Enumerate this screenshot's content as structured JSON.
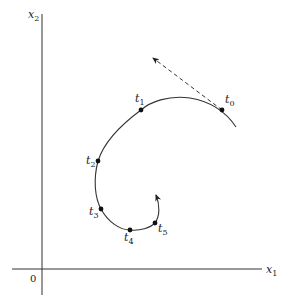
{
  "axes": {
    "x_label": {
      "base": "x",
      "sub": "1"
    },
    "y_label": {
      "base": "x",
      "sub": "2"
    },
    "origin_label": "0"
  },
  "points": [
    {
      "base": "t",
      "sub": "0",
      "x": 222,
      "y": 110,
      "lx": 225,
      "ly": 103
    },
    {
      "base": "t",
      "sub": "1",
      "x": 141,
      "y": 110,
      "lx": 135,
      "ly": 102
    },
    {
      "base": "t",
      "sub": "2",
      "x": 98,
      "y": 161,
      "lx": 86,
      "ly": 164
    },
    {
      "base": "t",
      "sub": "3",
      "x": 101,
      "y": 209,
      "lx": 89,
      "ly": 215
    },
    {
      "base": "t",
      "sub": "4",
      "x": 130,
      "y": 230,
      "lx": 124,
      "ly": 241
    },
    {
      "base": "t",
      "sub": "5",
      "x": 155,
      "y": 223,
      "lx": 158,
      "ly": 232
    }
  ],
  "colors": {
    "line": "#333333",
    "text": "#222222"
  }
}
